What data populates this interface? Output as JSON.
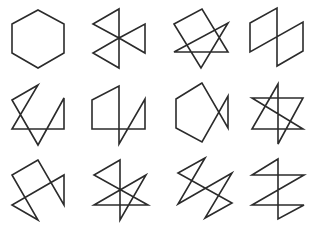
{
  "figure": {
    "stroke_color": "#2b2b2b",
    "background": "#ffffff",
    "rows": 3,
    "cols": 4
  },
  "shapes": [
    {
      "id": "hexagon",
      "x": 0,
      "y": 0,
      "points": "38,10 64,24 64,53 38,68 12,53 12,24"
    },
    {
      "id": "pinwheel",
      "x": 80,
      "y": 0,
      "points": "39,9 39,68 13,53 39,38 65,53 65,24 39,38 13,24"
    },
    {
      "id": "rect-triangle",
      "x": 160,
      "y": 0,
      "points": "14,24 42,9 68,52 14,52 68,23 41,68"
    },
    {
      "id": "double-parallelogram",
      "x": 238,
      "y": 0,
      "points": "12,23 39,8 39,66 65,51 65,22 12,52"
    },
    {
      "id": "zigzag-a",
      "x": 0,
      "y": 78,
      "points": "12,22 38,7 12,51 64,51 64,20 38,67"
    },
    {
      "id": "zigzag-b",
      "x": 80,
      "y": 78,
      "points": "12,22 39,8 39,66 65,21 65,51 12,51"
    },
    {
      "id": "pentagon-bowtie",
      "x": 160,
      "y": 78,
      "points": "42,5 16,21 16,50 42,64 68,18 68,50"
    },
    {
      "id": "star-variant",
      "x": 238,
      "y": 78,
      "points": "40,6 14,51 65,51 14,20 65,20 40,66"
    },
    {
      "id": "zigzag-c",
      "x": 0,
      "y": 153,
      "points": "38,7 12,22 38,67 12,52 64,22 64,52"
    },
    {
      "id": "star-triangle",
      "x": 80,
      "y": 153,
      "points": "40,7 14,22 68,52 14,52 66,22 40,67"
    },
    {
      "id": "lightning-a",
      "x": 160,
      "y": 153,
      "points": "45,5 18,20 72,50 45,65 72,20 18,51"
    },
    {
      "id": "lightning-b",
      "x": 238,
      "y": 153,
      "points": "40,6 14,22 66,22 14,52 66,52 40,66"
    }
  ]
}
